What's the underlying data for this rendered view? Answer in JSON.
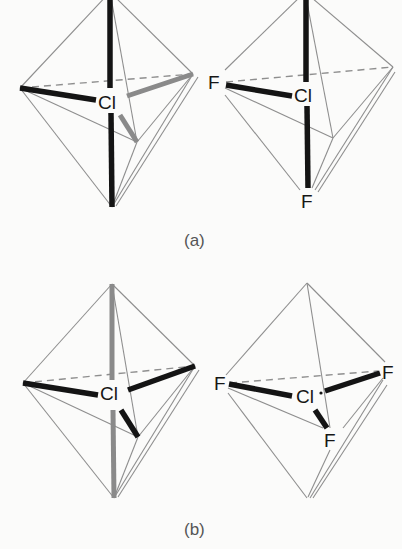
{
  "figure": {
    "panels": [
      {
        "id": "a",
        "caption": "(a)",
        "structures": [
          {
            "name": "octahedron-a-left",
            "central_atom": "Cl",
            "ligand_labels": []
          },
          {
            "name": "octahedron-a-right",
            "central_atom": "Cl",
            "ligand_labels": [
              "F",
              "F"
            ]
          }
        ]
      },
      {
        "id": "b",
        "caption": "(b)",
        "structures": [
          {
            "name": "octahedron-b-left",
            "central_atom": "Cl",
            "ligand_labels": []
          },
          {
            "name": "octahedron-b-right",
            "central_atom": "Cl",
            "ligand_labels": [
              "F",
              "F",
              "F"
            ]
          }
        ]
      }
    ]
  },
  "labels": {
    "cl": "Cl",
    "f": "F",
    "caption_a": "(a)",
    "caption_b": "(b)"
  },
  "colors": {
    "background": "#fbfbfa",
    "bond_dark": "#141414",
    "bond_grey": "#8a8a8a",
    "edge": "#8e8e8e",
    "text": "#161616",
    "caption": "#555555"
  }
}
